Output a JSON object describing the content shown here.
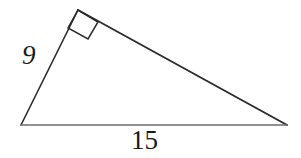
{
  "figure": {
    "type": "right-triangle-diagram",
    "background_color": "#ffffff",
    "stroke_color": "#2b2b2b",
    "text_color": "#1a1a1a",
    "vertices": {
      "bottom_left": {
        "x": 21,
        "y": 125
      },
      "apex": {
        "x": 78,
        "y": 10
      },
      "bottom_right": {
        "x": 287,
        "y": 125
      }
    },
    "sides": [
      {
        "name": "leg-left",
        "from": "bottom_left",
        "to": "apex",
        "label": "9"
      },
      {
        "name": "hypotenuse-slant",
        "from": "apex",
        "to": "bottom_right",
        "label": ""
      },
      {
        "name": "base",
        "from": "bottom_left",
        "to": "bottom_right",
        "label": "15"
      }
    ],
    "right_angle": {
      "at_vertex": "apex",
      "marker": "square",
      "points": "78,10 98,22 88,39 68,28"
    },
    "labels": {
      "leg": "9",
      "base": "15"
    }
  }
}
